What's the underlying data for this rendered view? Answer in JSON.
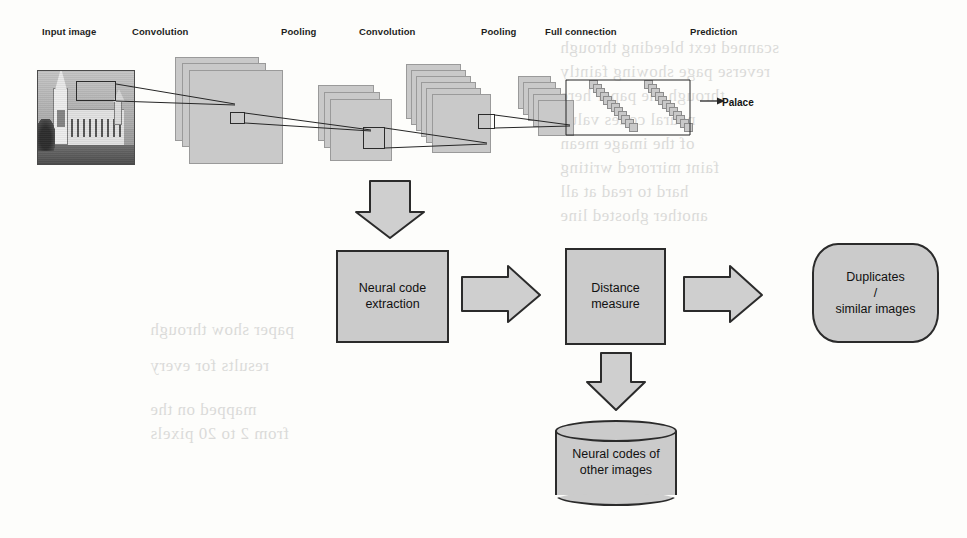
{
  "figure": {
    "kind": "cnn-pipeline-diagram",
    "colors": {
      "plane_fill": "#c9c9c9",
      "plane_stroke": "#9a9a9a",
      "box_fill": "#cbcbcb",
      "box_stroke": "#2b2b2b",
      "arrow_fill": "#cfcfcf",
      "arrow_stroke": "#2b2b2b",
      "text": "#111111",
      "page_background": "#fdfdfb",
      "ghost_text": "#8d8d8d"
    }
  },
  "cnn": {
    "labels": [
      {
        "id": "input-image",
        "text": "Input image"
      },
      {
        "id": "convolution-1",
        "text": "Convolution"
      },
      {
        "id": "pooling-1",
        "text": "Pooling"
      },
      {
        "id": "convolution-2",
        "text": "Convolution"
      },
      {
        "id": "pooling-2",
        "text": "Pooling"
      },
      {
        "id": "full-connection",
        "text": "Full connection"
      },
      {
        "id": "prediction",
        "text": "Prediction"
      }
    ],
    "prediction_output": "Palace",
    "layer_counts": {
      "convolution_1_planes": 3,
      "pooling_1_planes": 3,
      "convolution_2_planes": 6,
      "pooling_2_planes": 5,
      "fc_columns": 2,
      "fc_units_per_column": 12
    },
    "input_image_alt": "Grayscale photograph of a gothic palace with a tall clock tower"
  },
  "pipeline": {
    "steps": [
      {
        "id": "neural-code-extraction",
        "lines": [
          "Neural code",
          "extraction"
        ]
      },
      {
        "id": "distance-measure",
        "lines": [
          "Distance",
          "measure"
        ]
      },
      {
        "id": "duplicates-similar",
        "lines": [
          "Duplicates",
          "/",
          "similar images"
        ]
      }
    ],
    "datastore": {
      "id": "neural-codes-store",
      "lines": [
        "Neural codes of",
        "other images"
      ]
    },
    "arrows": [
      {
        "id": "cnn-to-extraction",
        "direction": "down"
      },
      {
        "id": "extraction-to-distance",
        "direction": "right"
      },
      {
        "id": "distance-to-duplicates",
        "direction": "right"
      },
      {
        "id": "distance-to-datastore",
        "direction": "down"
      },
      {
        "id": "fc-to-prediction",
        "direction": "right"
      }
    ]
  },
  "ghost_lines": [
    {
      "text": "scanned text bleeding through",
      "x": 560,
      "y": 38,
      "size": 17
    },
    {
      "text": "reverse page showing faintly",
      "x": 560,
      "y": 62,
      "size": 17
    },
    {
      "text": "through the paper here",
      "x": 560,
      "y": 86,
      "size": 17
    },
    {
      "text": "neural codes value",
      "x": 560,
      "y": 110,
      "size": 17
    },
    {
      "text": "of the image mean",
      "x": 560,
      "y": 134,
      "size": 17
    },
    {
      "text": "faint mirrored writing",
      "x": 560,
      "y": 158,
      "size": 17
    },
    {
      "text": "hard to read at all",
      "x": 560,
      "y": 182,
      "size": 17
    },
    {
      "text": "another ghosted line",
      "x": 560,
      "y": 206,
      "size": 17
    },
    {
      "text": "paper show through",
      "x": 150,
      "y": 320,
      "size": 17
    },
    {
      "text": "results for every",
      "x": 150,
      "y": 356,
      "size": 17
    },
    {
      "text": "mapped on the",
      "x": 150,
      "y": 400,
      "size": 17
    },
    {
      "text": "from 2 to 20 pixels",
      "x": 150,
      "y": 424,
      "size": 17
    }
  ]
}
